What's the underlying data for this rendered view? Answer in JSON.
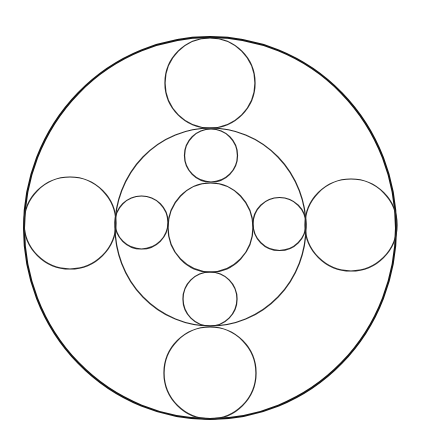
{
  "diagram": {
    "title": "",
    "stroke_color": "#111111",
    "background": "#ffffff",
    "shapes": [
      {
        "name": "outer-circle",
        "role": "outer"
      },
      {
        "name": "top-large-circle",
        "role": "inner"
      },
      {
        "name": "bottom-large-circle",
        "role": "inner"
      },
      {
        "name": "left-large-circle",
        "role": "inner"
      },
      {
        "name": "right-large-circle",
        "role": "inner"
      },
      {
        "name": "middle-circle",
        "role": "inner"
      },
      {
        "name": "center-circle",
        "role": "inner"
      },
      {
        "name": "top-small-circle",
        "role": "inner"
      },
      {
        "name": "bottom-small-circle",
        "role": "inner"
      },
      {
        "name": "left-small-circle",
        "role": "inner"
      },
      {
        "name": "right-small-circle",
        "role": "inner"
      }
    ]
  }
}
